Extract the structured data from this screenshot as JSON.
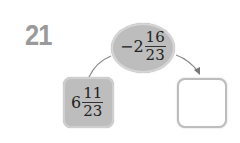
{
  "problem": {
    "number": "21",
    "operator": {
      "sign": "−",
      "whole": "2",
      "numerator": "16",
      "denominator": "23"
    },
    "input": {
      "whole": "6",
      "numerator": "11",
      "denominator": "23"
    },
    "answer": ""
  },
  "colors": {
    "shape_fill": "#bdbdbd",
    "number_color": "#9a9a9a",
    "arrow_color": "#777777"
  }
}
